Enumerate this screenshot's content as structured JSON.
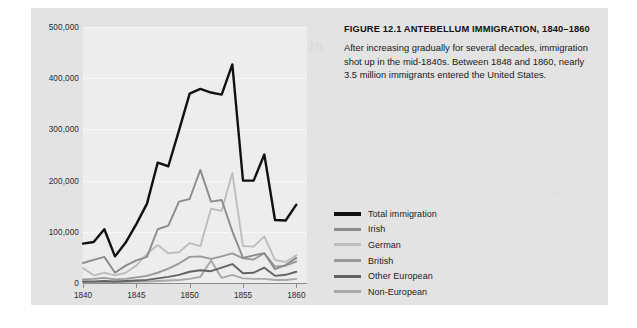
{
  "figure": {
    "caption_title": "FIGURE 12.1    ANTEBELLUM IMMIGRATION, 1840–1860",
    "caption_body": "After increasing gradually for several decades, immigration shot up in the mid-1840s. Between 1848 and 1860, nearly 3.5 million immigrants entered the United States."
  },
  "ghost_text": {
    "heading": "nt Movement",
    "line1": "decades, immigration",
    "line2": "Between 1848 and 1860,",
    "line3": "immigrants entered the",
    "right": "of"
  },
  "colors": {
    "page_background": "#ffffff",
    "panel_background": "#e3e3e3",
    "plot_background": "#ededed",
    "gridline": "#f7f7f7",
    "axis": "#8b8b8b",
    "text": "#1c1c1c",
    "total_immigration": "#111111",
    "irish": "#8c8c8c",
    "german": "#bdbdbd",
    "british": "#9a9a9a",
    "other_european": "#636363",
    "non_european": "#a8a8a8"
  },
  "legend": {
    "position": "right",
    "items": [
      {
        "label": "Total immigration",
        "color": "#111111",
        "thick": true
      },
      {
        "label": "Irish",
        "color": "#8c8c8c",
        "thick": false
      },
      {
        "label": "German",
        "color": "#bdbdbd",
        "thick": false
      },
      {
        "label": "British",
        "color": "#9a9a9a",
        "thick": false
      },
      {
        "label": "Other European",
        "color": "#636363",
        "thick": false
      },
      {
        "label": "Non-European",
        "color": "#a8a8a8",
        "thick": false
      }
    ]
  },
  "chart_data": {
    "type": "line",
    "title": "ANTEBELLUM IMMIGRATION, 1840–1860",
    "xlabel": "",
    "ylabel": "",
    "xlim": [
      1840,
      1861
    ],
    "ylim": [
      0,
      500000
    ],
    "grid": true,
    "legend_position": "right",
    "x": [
      1840,
      1841,
      1842,
      1843,
      1844,
      1845,
      1846,
      1847,
      1848,
      1849,
      1850,
      1851,
      1852,
      1853,
      1854,
      1855,
      1856,
      1857,
      1858,
      1859,
      1860,
      1861
    ],
    "xticks": [
      1840,
      1845,
      1850,
      1855,
      1860
    ],
    "xtick_labels": [
      "1840",
      "1845",
      "1850",
      "1855",
      "1860"
    ],
    "yticks": [
      0,
      100000,
      200000,
      300000,
      400000,
      500000
    ],
    "ytick_labels": [
      "0",
      "100,000",
      "200,000",
      "300,000",
      "400,000",
      "500,000"
    ],
    "series": [
      {
        "name": "Total immigration",
        "color": "#111111",
        "values": [
          77000,
          80000,
          105000,
          52000,
          79000,
          115000,
          155000,
          235000,
          228000,
          298000,
          370000,
          379000,
          372000,
          368000,
          427000,
          200000,
          200000,
          251000,
          123000,
          122000,
          153000,
          null
        ]
      },
      {
        "name": "Irish",
        "color": "#8c8c8c",
        "values": [
          39000,
          45000,
          51000,
          20000,
          34000,
          44000,
          51000,
          105000,
          112000,
          159000,
          164000,
          221000,
          159000,
          162000,
          101000,
          49000,
          54000,
          58000,
          27000,
          35000,
          49000,
          null
        ]
      },
      {
        "name": "German",
        "color": "#bdbdbd",
        "values": [
          29000,
          15000,
          20000,
          15000,
          20000,
          34000,
          57000,
          74000,
          58000,
          60000,
          78000,
          72000,
          145000,
          141000,
          215000,
          72000,
          71000,
          91000,
          45000,
          41000,
          54000,
          null
        ]
      },
      {
        "name": "British",
        "color": "#9a9a9a",
        "values": [
          7000,
          8000,
          10000,
          7000,
          8000,
          11000,
          14000,
          20000,
          28000,
          38000,
          51000,
          52000,
          47000,
          52000,
          58000,
          48000,
          46000,
          58000,
          32000,
          34000,
          42000,
          null
        ]
      },
      {
        "name": "Other European",
        "color": "#636363",
        "values": [
          3000,
          3000,
          4000,
          3000,
          4000,
          5000,
          6000,
          9000,
          12000,
          16000,
          22000,
          25000,
          23000,
          30000,
          37000,
          19000,
          20000,
          30000,
          14000,
          16000,
          22000,
          null
        ]
      },
      {
        "name": "Non-European",
        "color": "#a8a8a8",
        "values": [
          2000,
          2000,
          2000,
          2000,
          2000,
          3000,
          3000,
          4000,
          5000,
          6000,
          8000,
          12000,
          44000,
          10000,
          16000,
          9000,
          8000,
          8000,
          6000,
          6000,
          8000,
          null
        ]
      }
    ]
  }
}
